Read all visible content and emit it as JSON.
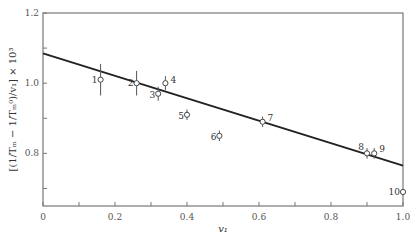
{
  "chart_data": {
    "type": "scatter",
    "title": "",
    "xlabel": "v₁",
    "ylabel": "[(1/Tₘ − 1/Tₘ⁰)/v₁] × 10³",
    "xlim": [
      0,
      1.0
    ],
    "ylim": [
      0.65,
      1.2
    ],
    "x_ticks": [
      "0",
      "0.2",
      "0.4",
      "0.6",
      "0.8",
      "1.0"
    ],
    "y_ticks": [
      "0.8",
      "1.0",
      "1.2"
    ],
    "grid": false,
    "legend": null,
    "series": [
      {
        "name": "data",
        "style": "open-circle-with-error-bars",
        "points": [
          {
            "label": "1",
            "x": 0.16,
            "y": 1.01,
            "err": 0.045
          },
          {
            "label": "2",
            "x": 0.26,
            "y": 1.0,
            "err": 0.035
          },
          {
            "label": "3",
            "x": 0.32,
            "y": 0.97,
            "err": 0.02
          },
          {
            "label": "4",
            "x": 0.34,
            "y": 1.0,
            "err": 0.02
          },
          {
            "label": "5",
            "x": 0.4,
            "y": 0.91,
            "err": 0.015
          },
          {
            "label": "6",
            "x": 0.49,
            "y": 0.85,
            "err": 0.015
          },
          {
            "label": "7",
            "x": 0.61,
            "y": 0.89,
            "err": 0.015
          },
          {
            "label": "8",
            "x": 0.9,
            "y": 0.8,
            "err": 0.015
          },
          {
            "label": "9",
            "x": 0.92,
            "y": 0.8,
            "err": 0.015
          },
          {
            "label": "10",
            "x": 1.0,
            "y": 0.69,
            "err": 0.0
          }
        ]
      },
      {
        "name": "linear fit",
        "style": "line",
        "x": [
          0,
          1.0
        ],
        "y": [
          1.085,
          0.765
        ]
      }
    ]
  }
}
